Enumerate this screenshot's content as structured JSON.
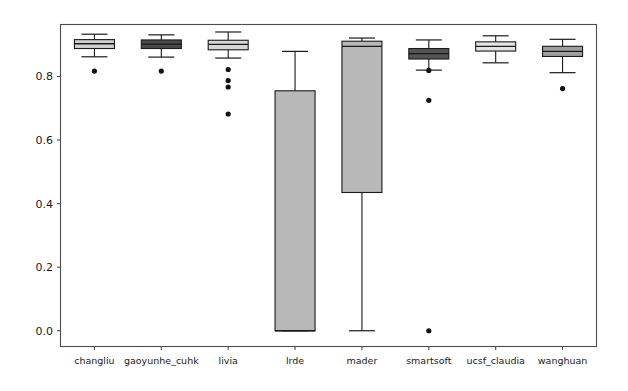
{
  "chart_data": {
    "type": "box",
    "title": "",
    "xlabel": "",
    "ylabel": "",
    "ylim": [
      -0.048,
      0.962
    ],
    "xlim": [
      0,
      8
    ],
    "grid": false,
    "legend": null,
    "ytick_labels": [
      "0.0",
      "0.2",
      "0.4",
      "0.6",
      "0.8"
    ],
    "ytick_values": [
      0.0,
      0.2,
      0.4,
      0.6,
      0.8
    ],
    "categories": [
      "changliu",
      "gaoyunhe_cuhk",
      "livia",
      "lrde",
      "mader",
      "smartsoft",
      "ucsf_claudia",
      "wanghuan"
    ],
    "boxes": [
      {
        "name": "changliu",
        "fill_color": "#d0d0d0",
        "whisker_low": 0.862,
        "q1": 0.888,
        "median": 0.903,
        "q3": 0.916,
        "whisker_high": 0.933,
        "outliers": [
          0.817
        ]
      },
      {
        "name": "gaoyunhe_cuhk",
        "fill_color": "#4a4a4a",
        "whisker_low": 0.861,
        "q1": 0.888,
        "median": 0.902,
        "q3": 0.915,
        "whisker_high": 0.931,
        "outliers": [
          0.817
        ]
      },
      {
        "name": "livia",
        "fill_color": "#d6d6d6",
        "whisker_low": 0.858,
        "q1": 0.884,
        "median": 0.901,
        "q3": 0.914,
        "whisker_high": 0.94,
        "outliers": [
          0.822,
          0.787,
          0.767,
          0.682
        ]
      },
      {
        "name": "lrde",
        "fill_color": "#b8b8b8",
        "whisker_low": 0.0,
        "q1": 0.0,
        "median": 0.0,
        "q3": 0.755,
        "whisker_high": 0.879,
        "outliers": []
      },
      {
        "name": "mader",
        "fill_color": "#b8b8b8",
        "whisker_low": 0.0,
        "q1": 0.435,
        "median": 0.895,
        "q3": 0.911,
        "whisker_high": 0.921,
        "outliers": []
      },
      {
        "name": "smartsoft",
        "fill_color": "#555555",
        "whisker_low": 0.82,
        "q1": 0.855,
        "median": 0.872,
        "q3": 0.888,
        "whisker_high": 0.915,
        "outliers": [
          0.819,
          0.725,
          0.0
        ]
      },
      {
        "name": "ucsf_claudia",
        "fill_color": "#e4e4e4",
        "whisker_low": 0.843,
        "q1": 0.88,
        "median": 0.895,
        "q3": 0.909,
        "whisker_high": 0.928,
        "outliers": []
      },
      {
        "name": "wanghuan",
        "fill_color": "#9e9e9e",
        "whisker_low": 0.812,
        "q1": 0.863,
        "median": 0.879,
        "q3": 0.895,
        "whisker_high": 0.917,
        "outliers": [
          0.762
        ]
      }
    ]
  },
  "axes": {
    "frame_color": "#4d4d4d",
    "background_color": "#ffffff"
  }
}
